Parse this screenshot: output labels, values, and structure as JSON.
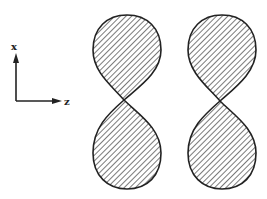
{
  "diagram": {
    "axes": {
      "vertical_label": "x",
      "horizontal_label": "z"
    },
    "orbitals": [
      {
        "name": "lobe-pair-1",
        "center_x": 124,
        "center_y": 100
      },
      {
        "name": "lobe-pair-2",
        "center_x": 220,
        "center_y": 101
      }
    ],
    "colors": {
      "stroke": "#222222",
      "hatch": "#333333",
      "background": "#ffffff"
    }
  }
}
